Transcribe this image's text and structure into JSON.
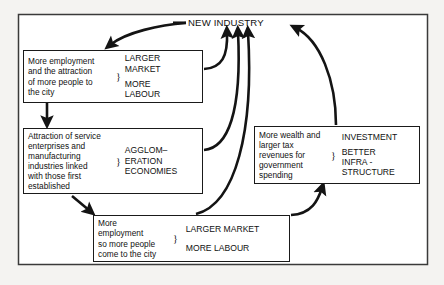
{
  "diagram": {
    "title": "NEW INDUSTRY",
    "frame": {
      "border_color": "#1a1a1a",
      "background": "#ffffff"
    },
    "page_background": "#f4f3f1",
    "ink_color": "#111111",
    "brace_glyph": "}",
    "nodes": [
      {
        "id": "node-1",
        "description": "More employment\nand the attraction\nof more people to\nthe  city",
        "effects_line1": "LARGER\nMARKET",
        "effects_line2": "MORE\nLABOUR"
      },
      {
        "id": "node-2",
        "description": "Attraction of service\nenterprises and\nmanufacturing\nindustries linked\nwith those first\nestablished",
        "effects_line1": "AGGLOM–\nERATION\nECONOMIES",
        "effects_line2": ""
      },
      {
        "id": "node-3",
        "description": "More\nemployment\nso more people\ncome to the city",
        "effects_line1": "LARGER MARKET",
        "effects_line2": "MORE LABOUR"
      },
      {
        "id": "node-4",
        "description": "More wealth and\nlarger tax\nrevenues for\ngovernment\nspending",
        "effects_line1": "INVESTMENT",
        "effects_line2": "BETTER\nINFRA -\nSTRUCTURE"
      }
    ],
    "arrows": [
      {
        "id": "arrow-title-to-node-1",
        "from": "NEW INDUSTRY",
        "to": "node-1"
      },
      {
        "id": "arrow-node-1-to-node-2",
        "from": "node-1",
        "to": "node-2"
      },
      {
        "id": "arrow-node-2-to-node-3",
        "from": "node-2",
        "to": "node-3"
      },
      {
        "id": "arrow-node-1-to-title",
        "from": "node-1",
        "to": "NEW INDUSTRY"
      },
      {
        "id": "arrow-node-2-to-title",
        "from": "node-2",
        "to": "NEW INDUSTRY"
      },
      {
        "id": "arrow-node-3-to-title",
        "from": "node-3",
        "to": "NEW INDUSTRY"
      },
      {
        "id": "arrow-node-3-to-node-4",
        "from": "node-3",
        "to": "node-4"
      },
      {
        "id": "arrow-node-4-to-title",
        "from": "node-4",
        "to": "NEW INDUSTRY"
      }
    ]
  }
}
